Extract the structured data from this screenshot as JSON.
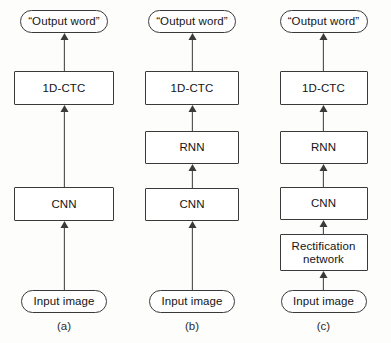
{
  "figure": {
    "background_color": "#fdfdfb",
    "stroke_color": "#3a3a3a",
    "text_color": "#141414",
    "columns": [
      {
        "caption": "(a)",
        "nodes": [
          {
            "label": "“Output word”",
            "shape": "rounded",
            "top": 10,
            "width": 88,
            "height": 23
          },
          {
            "label": "1D-CTC",
            "shape": "box",
            "top": 71,
            "width": 100,
            "height": 34
          },
          {
            "label": "CNN",
            "shape": "box",
            "top": 187,
            "width": 100,
            "height": 34
          },
          {
            "label": "Input image",
            "shape": "rounded",
            "top": 290,
            "width": 86,
            "height": 23
          }
        ],
        "arrows": [
          {
            "top": 33,
            "height": 38
          },
          {
            "top": 105,
            "height": 82
          },
          {
            "top": 221,
            "height": 69
          }
        ]
      },
      {
        "caption": "(b)",
        "nodes": [
          {
            "label": "“Output word”",
            "shape": "rounded",
            "top": 10,
            "width": 88,
            "height": 23
          },
          {
            "label": "1D-CTC",
            "shape": "box",
            "top": 71,
            "width": 94,
            "height": 34
          },
          {
            "label": "RNN",
            "shape": "box",
            "top": 131,
            "width": 94,
            "height": 33
          },
          {
            "label": "CNN",
            "shape": "box",
            "top": 188,
            "width": 94,
            "height": 33
          },
          {
            "label": "Input image",
            "shape": "rounded",
            "top": 290,
            "width": 86,
            "height": 23
          }
        ],
        "arrows": [
          {
            "top": 33,
            "height": 38
          },
          {
            "top": 105,
            "height": 26
          },
          {
            "top": 164,
            "height": 24
          },
          {
            "top": 221,
            "height": 69
          }
        ]
      },
      {
        "caption": "(c)",
        "nodes": [
          {
            "label": "“Output word”",
            "shape": "rounded",
            "top": 10,
            "width": 88,
            "height": 23
          },
          {
            "label": "1D-CTC",
            "shape": "box",
            "top": 71,
            "width": 88,
            "height": 34
          },
          {
            "label": "RNN",
            "shape": "box",
            "top": 131,
            "width": 88,
            "height": 33
          },
          {
            "label": "CNN",
            "shape": "box",
            "top": 187,
            "width": 88,
            "height": 33
          },
          {
            "label": "Rectification\nnetwork",
            "shape": "box",
            "top": 234,
            "width": 88,
            "height": 37
          },
          {
            "label": "Input image",
            "shape": "rounded",
            "top": 290,
            "width": 86,
            "height": 23
          }
        ],
        "arrows": [
          {
            "top": 33,
            "height": 38
          },
          {
            "top": 105,
            "height": 26
          },
          {
            "top": 164,
            "height": 23
          },
          {
            "top": 220,
            "height": 14
          },
          {
            "top": 271,
            "height": 19
          }
        ]
      }
    ]
  }
}
